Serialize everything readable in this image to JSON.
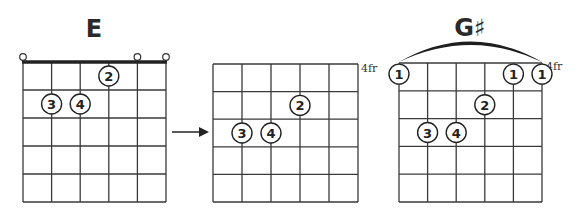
{
  "diagrams": [
    {
      "id": "e-chord",
      "title": "E",
      "x0": 23,
      "y0": 62,
      "x1": 166,
      "y1": 202,
      "strings": 6,
      "frets": 5,
      "nut": true,
      "fret_label": "",
      "open_strings": [
        1,
        5,
        6
      ],
      "fingers": [
        {
          "string": 4,
          "fret": 1,
          "finger": "2"
        },
        {
          "string": 2,
          "fret": 2,
          "finger": "3"
        },
        {
          "string": 3,
          "fret": 2,
          "finger": "4"
        }
      ],
      "barre": null
    },
    {
      "id": "e-shape-moved",
      "title": "",
      "x0": 213,
      "y0": 64,
      "x1": 358,
      "y1": 202,
      "strings": 6,
      "frets": 5,
      "nut": false,
      "fret_label": "4fr",
      "open_strings": [],
      "fingers": [
        {
          "string": 4,
          "fret": 2,
          "finger": "2"
        },
        {
          "string": 2,
          "fret": 3,
          "finger": "3"
        },
        {
          "string": 3,
          "fret": 3,
          "finger": "4"
        }
      ],
      "barre": null
    },
    {
      "id": "g-sharp-chord",
      "title": "G♯",
      "x0": 399,
      "y0": 63,
      "x1": 542,
      "y1": 202,
      "strings": 6,
      "frets": 5,
      "nut": false,
      "fret_label": "4fr",
      "open_strings": [],
      "fingers": [
        {
          "string": 1,
          "fret": 0.5,
          "finger": "1"
        },
        {
          "string": 5,
          "fret": 0.5,
          "finger": "1"
        },
        {
          "string": 6,
          "fret": 0.5,
          "finger": "1"
        },
        {
          "string": 4,
          "fret": 2,
          "finger": "2"
        },
        {
          "string": 2,
          "fret": 3,
          "finger": "3"
        },
        {
          "string": 3,
          "fret": 3,
          "finger": "4"
        }
      ],
      "barre": {
        "from_string": 1,
        "to_string": 6,
        "peak_y": 42
      }
    }
  ],
  "arrow": {
    "x1": 172,
    "x2": 208,
    "y": 132
  },
  "labels": {
    "e_title": "E",
    "g_sharp_title": "G♯",
    "fret_label_middle": "4fr",
    "fret_label_right": "4fr"
  }
}
